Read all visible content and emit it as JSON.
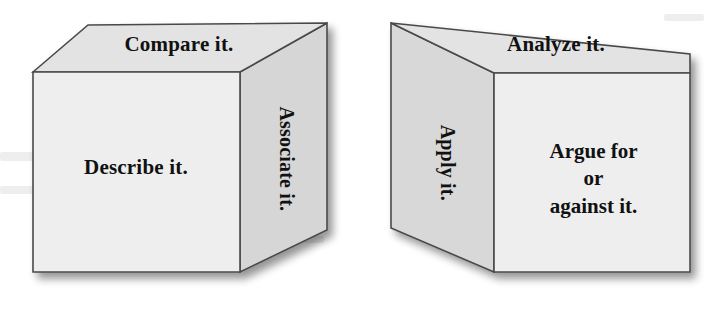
{
  "figure": {
    "colors": {
      "front_face": "#eeeeee",
      "top_face": "#e2e2e2",
      "side_face": "#d6d6d6",
      "edge_stroke": "#4a4a4a",
      "text": "#111111",
      "background": "#ffffff",
      "shadow": "#c9c9c9"
    },
    "cubes": [
      {
        "name": "left-cube",
        "faces": {
          "top": {
            "label": "Compare it.",
            "orientation": "horizontal"
          },
          "front": {
            "label": "Describe it.",
            "orientation": "horizontal"
          },
          "right": {
            "label": "Associate it.",
            "orientation": "rotated-90-cw"
          }
        }
      },
      {
        "name": "right-cube",
        "faces": {
          "top": {
            "label": "Analyze it.",
            "orientation": "horizontal"
          },
          "left": {
            "label": "Apply it.",
            "orientation": "rotated-90-cw"
          },
          "front": {
            "label_lines": [
              "Argue for",
              "or",
              "against it."
            ],
            "line1": "Argue for",
            "line2": "or",
            "line3": "against it.",
            "orientation": "horizontal"
          }
        }
      }
    ]
  }
}
